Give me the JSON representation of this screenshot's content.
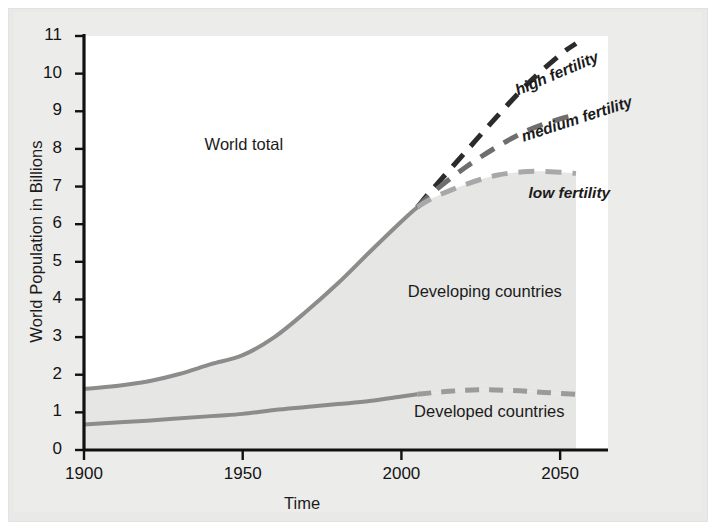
{
  "figure": {
    "background_color": "#ececeb",
    "plot_background_color": "#ffffff",
    "band_fill_color": "#e6e6e4",
    "axis_color": "#111111"
  },
  "chart_data": {
    "type": "line",
    "title": "",
    "xlabel": "Time",
    "ylabel": "World Population in Billions",
    "xlim": [
      1900,
      2055
    ],
    "ylim": [
      0,
      11
    ],
    "xticks": [
      1900,
      1950,
      2000,
      2050
    ],
    "xtick_labels": [
      "1900",
      "1950",
      "2000",
      "2050"
    ],
    "yticks": [
      0,
      1,
      2,
      3,
      4,
      5,
      6,
      7,
      8,
      9,
      10,
      11
    ],
    "ytick_labels": [
      "0",
      "1",
      "2",
      "3",
      "4",
      "5",
      "6",
      "7",
      "8",
      "9",
      "10",
      "11"
    ],
    "grid": false,
    "legend_position": "inline-annotations",
    "annotations": [
      {
        "text": "World total",
        "x": 1938,
        "y": 8.1
      },
      {
        "text": "Developing countries",
        "x": 2002,
        "y": 4.2
      },
      {
        "text": "Developed countries",
        "x": 2004,
        "y": 1.0
      },
      {
        "text": "high fertility",
        "x": 2036,
        "y": 9.5
      },
      {
        "text": "medium fertility",
        "x": 2038,
        "y": 8.3
      },
      {
        "text": "low fertility",
        "x": 2040,
        "y": 6.8
      }
    ],
    "series": [
      {
        "name": "World total (historical)",
        "style": "solid",
        "color": "#8c8c8c",
        "width": 4,
        "x": [
          1900,
          1910,
          1920,
          1930,
          1940,
          1950,
          1960,
          1970,
          1980,
          1990,
          2000,
          2005
        ],
        "values": [
          1.62,
          1.7,
          1.82,
          2.02,
          2.28,
          2.52,
          3.0,
          3.68,
          4.43,
          5.26,
          6.07,
          6.45
        ]
      },
      {
        "name": "World total - high fertility",
        "style": "dashed",
        "color": "#2b2b2b",
        "width": 5,
        "x": [
          2005,
          2010,
          2020,
          2030,
          2040,
          2050,
          2055
        ],
        "values": [
          6.45,
          6.95,
          7.9,
          8.85,
          9.75,
          10.5,
          10.8
        ]
      },
      {
        "name": "World total - medium fertility",
        "style": "dashed",
        "color": "#6e6e6e",
        "width": 5,
        "x": [
          2005,
          2010,
          2020,
          2030,
          2040,
          2050,
          2055
        ],
        "values": [
          6.45,
          6.85,
          7.5,
          8.05,
          8.5,
          8.8,
          8.9
        ]
      },
      {
        "name": "World total - low fertility",
        "style": "dashed",
        "color": "#a8a8a8",
        "width": 5,
        "x": [
          2005,
          2010,
          2020,
          2030,
          2040,
          2050,
          2055
        ],
        "values": [
          6.45,
          6.7,
          7.05,
          7.3,
          7.4,
          7.38,
          7.35
        ]
      },
      {
        "name": "Developed countries (historical)",
        "style": "solid",
        "color": "#8c8c8c",
        "width": 4,
        "x": [
          1900,
          1920,
          1940,
          1950,
          1960,
          1970,
          1980,
          1990,
          2000,
          2005
        ],
        "values": [
          0.68,
          0.78,
          0.9,
          0.96,
          1.06,
          1.14,
          1.22,
          1.3,
          1.42,
          1.48
        ]
      },
      {
        "name": "Developed countries (projected)",
        "style": "dashed",
        "color": "#9b9b9b",
        "width": 5,
        "x": [
          2005,
          2015,
          2025,
          2035,
          2045,
          2055
        ],
        "values": [
          1.48,
          1.56,
          1.6,
          1.58,
          1.53,
          1.48
        ]
      }
    ],
    "bands": [
      {
        "name": "Developing countries",
        "description": "Area between developed-countries line and world-total line",
        "fill": "#e6e6e4"
      },
      {
        "name": "Developed countries",
        "description": "Area below developed-countries line",
        "fill": "#e6e6e4"
      }
    ]
  }
}
